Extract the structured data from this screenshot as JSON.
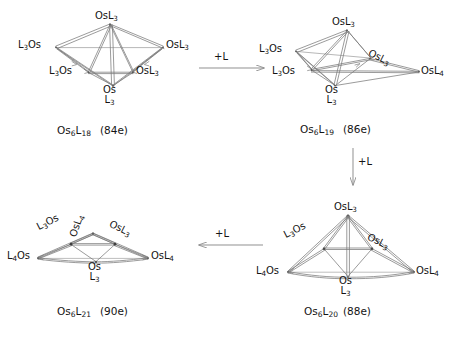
{
  "scheme": {
    "title": "Osmium cluster ligand addition scheme",
    "background": "#ffffff",
    "line_color": "#6e6e6e",
    "text_color": "#141414"
  },
  "arrows": [
    {
      "name": "arrow-top",
      "label": "+L",
      "direction": "right"
    },
    {
      "name": "arrow-right",
      "label": "+L",
      "direction": "down"
    },
    {
      "name": "arrow-bottom",
      "label": "+L",
      "direction": "left"
    }
  ],
  "structures": [
    {
      "id": "struct-1",
      "position": "top-left",
      "formula_main": "Os",
      "formula_sub1": "6",
      "formula_mid": "L",
      "formula_sub2": "18",
      "electron_count": "(84e)",
      "vertices": [
        {
          "name": "apex",
          "text": "OsL",
          "sub": "3"
        },
        {
          "name": "left",
          "text": "L",
          "sub": "3",
          "text2": "Os"
        },
        {
          "name": "right",
          "text": "OsL",
          "sub": "3"
        },
        {
          "name": "front-left",
          "text": "L",
          "sub": "3",
          "text2": "Os"
        },
        {
          "name": "front-right",
          "text": "OsL",
          "sub": "3"
        },
        {
          "name": "bottom",
          "text": "Os",
          "text2": "L",
          "sub": "3"
        }
      ]
    },
    {
      "id": "struct-2",
      "position": "top-right",
      "formula_main": "Os",
      "formula_sub1": "6",
      "formula_mid": "L",
      "formula_sub2": "19",
      "electron_count": "(86e)",
      "vertices": [
        {
          "name": "apex",
          "text": "OsL",
          "sub": "3"
        },
        {
          "name": "left",
          "text": "L",
          "sub": "3",
          "text2": "Os"
        },
        {
          "name": "right-upper",
          "text": "OsL",
          "sub": "3"
        },
        {
          "name": "front-left",
          "text": "L",
          "sub": "3",
          "text2": "Os"
        },
        {
          "name": "right",
          "text": "OsL",
          "sub": "4"
        },
        {
          "name": "bottom",
          "text": "Os",
          "text2": "L",
          "sub": "3"
        }
      ]
    },
    {
      "id": "struct-3",
      "position": "bottom-right",
      "formula_main": "Os",
      "formula_sub1": "6",
      "formula_mid": "L",
      "formula_sub2": "20",
      "electron_count": "(88e)",
      "vertices": [
        {
          "name": "apex",
          "text": "OsL",
          "sub": "3"
        },
        {
          "name": "upper-left",
          "text": "L",
          "sub": "3",
          "text2": "Os"
        },
        {
          "name": "upper-right",
          "text": "OsL",
          "sub": "3"
        },
        {
          "name": "left",
          "text": "L",
          "sub": "4",
          "text2": "Os"
        },
        {
          "name": "right",
          "text": "OsL",
          "sub": "4"
        },
        {
          "name": "bottom",
          "text": "Os",
          "text2": "L",
          "sub": "3"
        }
      ]
    },
    {
      "id": "struct-4",
      "position": "bottom-left",
      "formula_main": "Os",
      "formula_sub1": "6",
      "formula_mid": "L",
      "formula_sub2": "21",
      "electron_count": "(90e)",
      "vertices": [
        {
          "name": "apex",
          "text": "OsL",
          "sub": "4"
        },
        {
          "name": "upper-left",
          "text": "L",
          "sub": "3",
          "text2": "Os"
        },
        {
          "name": "upper-right",
          "text": "OsL",
          "sub": "3"
        },
        {
          "name": "left",
          "text": "L",
          "sub": "4",
          "text2": "Os"
        },
        {
          "name": "right",
          "text": "OsL",
          "sub": "4"
        },
        {
          "name": "bottom",
          "text": "Os",
          "text2": "L",
          "sub": "3"
        }
      ]
    }
  ]
}
